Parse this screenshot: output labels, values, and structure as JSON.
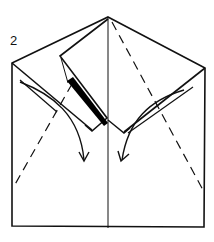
{
  "diagram": {
    "type": "origami-fold-step",
    "step_number": "2",
    "colors": {
      "line": "#111111",
      "paper": "#ffffff",
      "shadow": "#000000"
    },
    "elements": {
      "outline": "paper outline (pentagon: square with triangular top)",
      "center_crease": "vertical center crease",
      "valley_folds": [
        "left dashed valley fold line",
        "right dashed valley fold line"
      ],
      "flap": "folded-down left flap with black shadow edge",
      "arrows": [
        "left curved fold arrow",
        "right curved fold arrow"
      ]
    }
  }
}
